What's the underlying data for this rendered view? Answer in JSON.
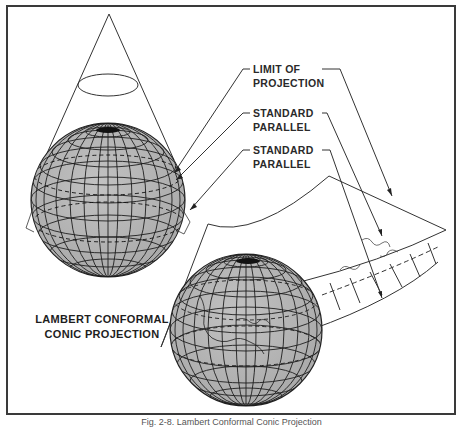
{
  "figure": {
    "title_lines": [
      "LAMBERT CONFORMAL",
      "CONIC PROJECTION"
    ],
    "caption": "Fig. 2-8. Lambert Conformal Conic Projection",
    "labels": [
      {
        "id": "limit-of-projection",
        "lines": [
          "LIMIT OF",
          "PROJECTION"
        ]
      },
      {
        "id": "standard-parallel-1",
        "lines": [
          "STANDARD",
          "PARALLEL"
        ]
      },
      {
        "id": "standard-parallel-2",
        "lines": [
          "STANDARD",
          "PARALLEL"
        ]
      }
    ],
    "colors": {
      "globe_fill": "#b4b4b4",
      "line": "#2a2a2a",
      "border": "#3a3a3a",
      "background": "#ffffff"
    }
  }
}
